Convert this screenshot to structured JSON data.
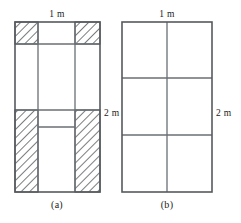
{
  "figure": {
    "caption_a": "(a)",
    "caption_b": "(b)",
    "width_label_a": "1 m",
    "height_label_a": "2 m",
    "width_label_b": "1 m",
    "height_label_b": "2 m",
    "stroke_color": "#555a5e",
    "inner_stroke_color": "#6a6f73",
    "hatch_color": "#4d5255",
    "background_color": "#ffffff"
  },
  "panel_a": {
    "name": "hatched-partition-diagram",
    "outer": {
      "x": 15,
      "y": 22,
      "width": 85,
      "height": 170
    },
    "vertical_lines_x": [
      15,
      38,
      75,
      100
    ],
    "horizontal_lines_y": [
      44,
      110,
      127
    ],
    "hatched_regions": [
      {
        "id": "top-left-corner",
        "x": 15,
        "y": 22,
        "width": 23,
        "height": 22
      },
      {
        "id": "top-right-corner",
        "x": 75,
        "y": 22,
        "width": 25,
        "height": 22
      },
      {
        "id": "bottom-left-column",
        "x": 15,
        "y": 110,
        "width": 23,
        "height": 82
      },
      {
        "id": "bottom-right-column",
        "x": 75,
        "y": 110,
        "width": 25,
        "height": 82
      }
    ]
  },
  "panel_b": {
    "name": "plain-partition-diagram",
    "outer": {
      "x": 122,
      "y": 22,
      "width": 90,
      "height": 170
    },
    "vertical_lines_x": [
      122,
      167,
      212
    ],
    "horizontal_lines_y": [
      78,
      135
    ]
  },
  "labels": {
    "a_width": {
      "text": "1 m",
      "x": 57,
      "y": 17
    },
    "a_height": {
      "text": "2 m",
      "x": 104,
      "y": 116
    },
    "b_width": {
      "text": "1 m",
      "x": 167,
      "y": 17
    },
    "b_height": {
      "text": "2 m",
      "x": 216,
      "y": 116
    },
    "a_caption": {
      "text": "(a)",
      "x": 57,
      "y": 208
    },
    "b_caption": {
      "text": "(b)",
      "x": 167,
      "y": 208
    }
  }
}
